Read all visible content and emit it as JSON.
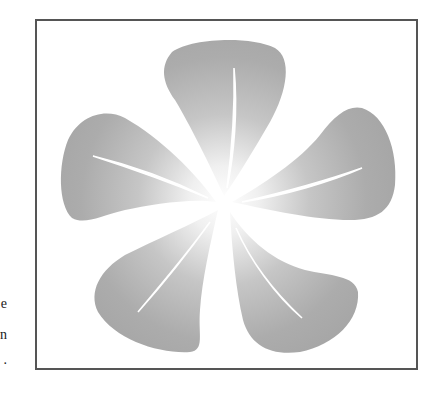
{
  "figure": {
    "petal_count": 5,
    "colors": {
      "frame": "#555555",
      "petal_outer": "#a9a9a9",
      "petal_inner": "#f4f4f4",
      "vein": "#ffffff",
      "background": "#ffffff"
    },
    "petals": [
      {
        "name": "top"
      },
      {
        "name": "right"
      },
      {
        "name": "bottom-right"
      },
      {
        "name": "bottom-left"
      },
      {
        "name": "left"
      }
    ]
  },
  "margin_fragments": [
    {
      "text": "e"
    },
    {
      "text": "n"
    },
    {
      "text": "."
    }
  ]
}
